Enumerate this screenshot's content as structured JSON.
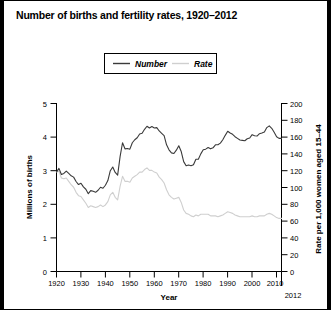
{
  "figure": {
    "title": "Number of births and fertility rates, 1920–2012"
  },
  "legend": {
    "entries": [
      {
        "label": "Number",
        "color": "#3a3a3a"
      },
      {
        "label": "Rate",
        "color": "#cfcfcf"
      }
    ]
  },
  "axes": {
    "x": {
      "label": "Year",
      "ticklabels": [
        "1920",
        "1930",
        "1940",
        "1950",
        "1960",
        "1970",
        "1980",
        "1990",
        "2000",
        "2010"
      ],
      "endlabel": "2012",
      "min": 1920,
      "max": 2012
    },
    "y_left": {
      "label": "Millions of births",
      "ticklabels": [
        "0",
        "1",
        "2",
        "3",
        "4",
        "5"
      ],
      "min": 0,
      "max": 5
    },
    "y_right": {
      "label": "Rate per 1,000 women aged 15–44",
      "ticklabels": [
        "0",
        "20",
        "40",
        "60",
        "80",
        "100",
        "120",
        "140",
        "160",
        "180",
        "200"
      ],
      "min": 0,
      "max": 200
    }
  },
  "chart_data": {
    "type": "line",
    "title": "Number of births and fertility rates, 1920–2012",
    "xlabel": "Year",
    "ylabel": "Millions of births",
    "y2label": "Rate per 1,000 women aged 15–44",
    "xlim": [
      1920,
      2012
    ],
    "ylim": [
      0,
      5
    ],
    "y2lim": [
      0,
      200
    ],
    "grid": false,
    "legend_position": "top-center",
    "x": [
      1920,
      1921,
      1922,
      1923,
      1924,
      1925,
      1926,
      1927,
      1928,
      1929,
      1930,
      1931,
      1932,
      1933,
      1934,
      1935,
      1936,
      1937,
      1938,
      1939,
      1940,
      1941,
      1942,
      1943,
      1944,
      1945,
      1946,
      1947,
      1948,
      1949,
      1950,
      1951,
      1952,
      1953,
      1954,
      1955,
      1956,
      1957,
      1958,
      1959,
      1960,
      1961,
      1962,
      1963,
      1964,
      1965,
      1966,
      1967,
      1968,
      1969,
      1970,
      1971,
      1972,
      1973,
      1974,
      1975,
      1976,
      1977,
      1978,
      1979,
      1980,
      1981,
      1982,
      1983,
      1984,
      1985,
      1986,
      1987,
      1988,
      1989,
      1990,
      1991,
      1992,
      1993,
      1994,
      1995,
      1996,
      1997,
      1998,
      1999,
      2000,
      2001,
      2002,
      2003,
      2004,
      2005,
      2006,
      2007,
      2008,
      2009,
      2010,
      2011,
      2012
    ],
    "series": [
      {
        "name": "Number",
        "axis": "left",
        "units": "millions of births",
        "color": "#3a3a3a",
        "values": [
          2.95,
          3.06,
          2.88,
          2.91,
          2.98,
          2.91,
          2.84,
          2.8,
          2.67,
          2.58,
          2.62,
          2.51,
          2.44,
          2.31,
          2.4,
          2.38,
          2.35,
          2.41,
          2.5,
          2.47,
          2.56,
          2.7,
          2.99,
          3.1,
          2.94,
          2.86,
          3.41,
          3.82,
          3.64,
          3.65,
          3.63,
          3.82,
          3.91,
          3.97,
          4.08,
          4.1,
          4.22,
          4.31,
          4.26,
          4.3,
          4.26,
          4.27,
          4.17,
          4.1,
          4.03,
          3.76,
          3.61,
          3.52,
          3.5,
          3.6,
          3.73,
          3.56,
          3.26,
          3.14,
          3.16,
          3.14,
          3.17,
          3.33,
          3.33,
          3.49,
          3.61,
          3.63,
          3.68,
          3.64,
          3.67,
          3.76,
          3.76,
          3.81,
          3.91,
          4.04,
          4.16,
          4.11,
          4.07,
          4.0,
          3.95,
          3.9,
          3.89,
          3.88,
          3.94,
          3.96,
          4.06,
          4.03,
          4.02,
          4.09,
          4.11,
          4.14,
          4.27,
          4.32,
          4.25,
          4.13,
          4.0,
          3.95,
          3.95
        ]
      },
      {
        "name": "Rate",
        "axis": "right",
        "units": "births per 1,000 women aged 15-44",
        "color": "#cfcfcf",
        "values": [
          118,
          119,
          111,
          110,
          111,
          107,
          103,
          100,
          94,
          90,
          89,
          85,
          81,
          76,
          78,
          77,
          76,
          77,
          79,
          77,
          79,
          83,
          91,
          94,
          88,
          85,
          101,
          113,
          107,
          107,
          106,
          111,
          113,
          115,
          118,
          118,
          121,
          123,
          120,
          120,
          118,
          117,
          112,
          109,
          105,
          97,
          91,
          88,
          86,
          87,
          88,
          82,
          73,
          69,
          68,
          66,
          65,
          67,
          66,
          68,
          68,
          68,
          68,
          66,
          66,
          66,
          65,
          66,
          67,
          69,
          71,
          70,
          69,
          67,
          66,
          65,
          65,
          65,
          65,
          65,
          66,
          65,
          65,
          66,
          66,
          66,
          68,
          69,
          68,
          66,
          64,
          63,
          63
        ]
      }
    ]
  }
}
